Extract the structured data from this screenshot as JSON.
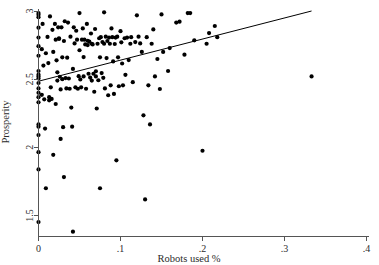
{
  "chart_data": {
    "type": "scatter",
    "title": "",
    "xlabel": "Robots used %",
    "ylabel": "Prosperity",
    "xlim": [
      0,
      0.4
    ],
    "ylim": [
      1.35,
      3.0
    ],
    "xticks": [
      0,
      0.1,
      0.2,
      0.3,
      0.4
    ],
    "xtick_labels": [
      "0",
      ".1",
      ".2",
      ".3",
      ".4"
    ],
    "yticks": [
      1.5,
      2.0,
      2.5,
      3.0
    ],
    "ytick_labels": [
      "1.5",
      "2",
      "2.5",
      "3"
    ],
    "grid": false,
    "legend": null,
    "marker": "filled-circle",
    "marker_color": "#000000",
    "fit_line": {
      "label": "linear fit",
      "color": "#000000",
      "x_start": 0.0,
      "y_start": 2.485,
      "x_end": 0.333,
      "y_end": 3.0,
      "slope": 1.546,
      "intercept": 2.485
    },
    "points": [
      [
        0.0,
        2.985
      ],
      [
        0.0,
        2.972
      ],
      [
        0.0,
        2.955
      ],
      [
        0.0,
        2.878
      ],
      [
        0.0,
        2.805
      ],
      [
        0.0,
        2.742
      ],
      [
        0.0,
        2.672
      ],
      [
        0.0,
        2.56
      ],
      [
        0.0,
        2.533
      ],
      [
        0.0,
        2.52
      ],
      [
        0.0,
        2.505
      ],
      [
        0.0,
        2.472
      ],
      [
        0.0,
        2.432
      ],
      [
        0.0,
        2.4
      ],
      [
        0.0,
        2.368
      ],
      [
        0.0,
        2.33
      ],
      [
        0.0,
        2.168
      ],
      [
        0.0,
        2.152
      ],
      [
        0.0,
        2.09
      ],
      [
        0.0,
        1.965
      ],
      [
        0.0,
        1.838
      ],
      [
        0.0,
        1.452
      ],
      [
        0.004,
        2.72
      ],
      [
        0.004,
        2.385
      ],
      [
        0.005,
        2.905
      ],
      [
        0.006,
        2.6
      ],
      [
        0.007,
        2.352
      ],
      [
        0.008,
        2.138
      ],
      [
        0.009,
        2.69
      ],
      [
        0.009,
        1.7
      ],
      [
        0.011,
        2.81
      ],
      [
        0.012,
        2.618
      ],
      [
        0.013,
        2.368
      ],
      [
        0.013,
        2.345
      ],
      [
        0.014,
        2.96
      ],
      [
        0.015,
        2.44
      ],
      [
        0.016,
        2.355
      ],
      [
        0.017,
        2.862
      ],
      [
        0.018,
        2.7
      ],
      [
        0.018,
        1.945
      ],
      [
        0.02,
        2.905
      ],
      [
        0.021,
        2.79
      ],
      [
        0.021,
        2.318
      ],
      [
        0.022,
        2.638
      ],
      [
        0.023,
        2.55
      ],
      [
        0.023,
        2.49
      ],
      [
        0.024,
        2.88
      ],
      [
        0.025,
        2.8
      ],
      [
        0.025,
        2.795
      ],
      [
        0.026,
        2.518
      ],
      [
        0.027,
        2.425
      ],
      [
        0.027,
        2.062
      ],
      [
        0.028,
        2.88
      ],
      [
        0.029,
        2.66
      ],
      [
        0.029,
        2.5
      ],
      [
        0.03,
        2.148
      ],
      [
        0.031,
        2.78
      ],
      [
        0.031,
        1.782
      ],
      [
        0.032,
        2.925
      ],
      [
        0.033,
        2.508
      ],
      [
        0.034,
        2.432
      ],
      [
        0.035,
        2.658
      ],
      [
        0.036,
        2.915
      ],
      [
        0.037,
        2.505
      ],
      [
        0.038,
        2.43
      ],
      [
        0.039,
        2.812
      ],
      [
        0.04,
        2.292
      ],
      [
        0.041,
        2.152
      ],
      [
        0.042,
        2.575
      ],
      [
        0.042,
        1.382
      ],
      [
        0.043,
        2.88
      ],
      [
        0.044,
        2.762
      ],
      [
        0.045,
        2.44
      ],
      [
        0.046,
        2.855
      ],
      [
        0.047,
        2.79
      ],
      [
        0.048,
        2.43
      ],
      [
        0.049,
        2.522
      ],
      [
        0.05,
        2.985
      ],
      [
        0.05,
        2.712
      ],
      [
        0.051,
        2.498
      ],
      [
        0.052,
        2.44
      ],
      [
        0.053,
        2.79
      ],
      [
        0.054,
        2.872
      ],
      [
        0.055,
        2.662
      ],
      [
        0.055,
        2.52
      ],
      [
        0.056,
        2.79
      ],
      [
        0.057,
        2.755
      ],
      [
        0.058,
        2.43
      ],
      [
        0.059,
        2.905
      ],
      [
        0.06,
        2.782
      ],
      [
        0.06,
        2.75
      ],
      [
        0.061,
        2.54
      ],
      [
        0.062,
        2.775
      ],
      [
        0.063,
        2.512
      ],
      [
        0.064,
        2.835
      ],
      [
        0.065,
        2.76
      ],
      [
        0.065,
        2.49
      ],
      [
        0.066,
        2.755
      ],
      [
        0.067,
        2.54
      ],
      [
        0.068,
        2.408
      ],
      [
        0.069,
        2.868
      ],
      [
        0.07,
        2.558
      ],
      [
        0.07,
        2.52
      ],
      [
        0.071,
        2.285
      ],
      [
        0.072,
        2.76
      ],
      [
        0.073,
        2.492
      ],
      [
        0.074,
        2.8
      ],
      [
        0.075,
        2.66
      ],
      [
        0.075,
        1.7
      ],
      [
        0.076,
        2.808
      ],
      [
        0.077,
        2.545
      ],
      [
        0.078,
        2.772
      ],
      [
        0.079,
        2.51
      ],
      [
        0.08,
        2.99
      ],
      [
        0.08,
        2.76
      ],
      [
        0.081,
        2.432
      ],
      [
        0.082,
        2.812
      ],
      [
        0.083,
        2.655
      ],
      [
        0.084,
        2.78
      ],
      [
        0.085,
        2.382
      ],
      [
        0.086,
        2.805
      ],
      [
        0.087,
        2.76
      ],
      [
        0.088,
        2.455
      ],
      [
        0.089,
        2.872
      ],
      [
        0.09,
        2.808
      ],
      [
        0.091,
        2.63
      ],
      [
        0.092,
        2.392
      ],
      [
        0.093,
        2.758
      ],
      [
        0.094,
        2.805
      ],
      [
        0.095,
        1.905
      ],
      [
        0.096,
        2.812
      ],
      [
        0.097,
        2.66
      ],
      [
        0.098,
        2.448
      ],
      [
        0.1,
        2.852
      ],
      [
        0.101,
        2.77
      ],
      [
        0.102,
        2.615
      ],
      [
        0.103,
        2.455
      ],
      [
        0.105,
        2.8
      ],
      [
        0.106,
        2.532
      ],
      [
        0.108,
        2.805
      ],
      [
        0.11,
        2.64
      ],
      [
        0.112,
        2.76
      ],
      [
        0.113,
        2.808
      ],
      [
        0.115,
        2.478
      ],
      [
        0.118,
        2.772
      ],
      [
        0.12,
        2.968
      ],
      [
        0.122,
        2.812
      ],
      [
        0.124,
        2.762
      ],
      [
        0.126,
        2.7
      ],
      [
        0.128,
        2.235
      ],
      [
        0.13,
        1.618
      ],
      [
        0.132,
        2.808
      ],
      [
        0.134,
        2.455
      ],
      [
        0.136,
        2.168
      ],
      [
        0.138,
        2.76
      ],
      [
        0.14,
        2.865
      ],
      [
        0.142,
        2.52
      ],
      [
        0.145,
        2.648
      ],
      [
        0.148,
        2.428
      ],
      [
        0.15,
        2.975
      ],
      [
        0.152,
        2.7
      ],
      [
        0.158,
        2.56
      ],
      [
        0.16,
        2.728
      ],
      [
        0.168,
        2.915
      ],
      [
        0.172,
        2.922
      ],
      [
        0.178,
        2.68
      ],
      [
        0.182,
        2.985
      ],
      [
        0.185,
        2.985
      ],
      [
        0.19,
        2.785
      ],
      [
        0.2,
        1.975
      ],
      [
        0.205,
        2.76
      ],
      [
        0.208,
        2.838
      ],
      [
        0.215,
        2.89
      ],
      [
        0.218,
        2.808
      ],
      [
        0.333,
        2.52
      ]
    ]
  },
  "figure": {
    "background": "#ffffff",
    "axis_color": "#555555",
    "text_color": "#2b2b2b"
  }
}
